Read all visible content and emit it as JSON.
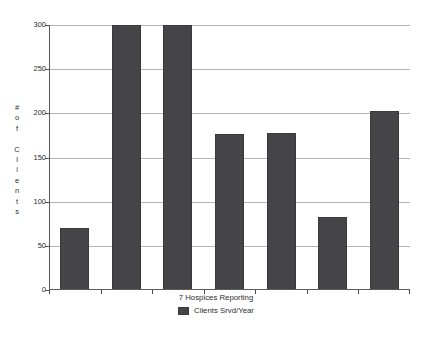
{
  "chart_data": {
    "type": "bar",
    "title": "",
    "subtitle": "",
    "xlabel": "7 Hospices Reporting",
    "ylabel": "# of Clients",
    "ylabel_chars": [
      "#",
      "o",
      "f",
      "",
      "C",
      "l",
      "i",
      "e",
      "n",
      "t",
      "s"
    ],
    "categories": [
      "",
      "",
      "",
      "",
      "",
      "",
      ""
    ],
    "values": [
      70,
      303,
      303,
      177,
      178,
      83,
      203
    ],
    "series": [
      {
        "name": "Clients Srvd/Year",
        "values": [
          70,
          303,
          303,
          177,
          178,
          83,
          203
        ],
        "color": "#454548"
      }
    ],
    "ylim": [
      0,
      300
    ],
    "yticks": [
      0,
      50,
      100,
      150,
      200,
      250,
      300
    ],
    "ytick_labels": [
      "0",
      "50",
      "100",
      "150",
      "200",
      "250",
      "300"
    ],
    "xtick_labels": [],
    "grid": true,
    "grid_axis": "y",
    "legend": {
      "position": "bottom-center",
      "entries": [
        {
          "label": "Clients Srvd/Year",
          "color": "#454548"
        }
      ]
    },
    "colors": {
      "bar_fill": "#454548",
      "bar_edge": "#3a3a3d",
      "gridline": "#b4b4b4",
      "axis": "#5a5a5a",
      "text": "#2d2d2d",
      "background": "#ffffff"
    }
  }
}
